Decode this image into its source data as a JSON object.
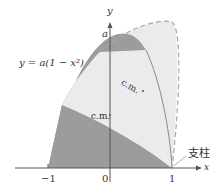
{
  "figure": {
    "equation_label": "y = a(1 − x²)",
    "y_axis_label": "y",
    "x_axis_label": "x",
    "peak_label": "a",
    "cm_label_rotated": "c.m.",
    "cm_label_original": "c.m.",
    "support_label": "支柱",
    "ticks": {
      "neg_one": "−1",
      "zero": "0",
      "one": "1"
    },
    "colors": {
      "dark_region": "#9c9c9c",
      "light_region": "#ebebeb",
      "axis": "#555555",
      "dashed_curve": "#a8a8a8",
      "rotated_axis_curve": "#8a8a8a"
    }
  }
}
